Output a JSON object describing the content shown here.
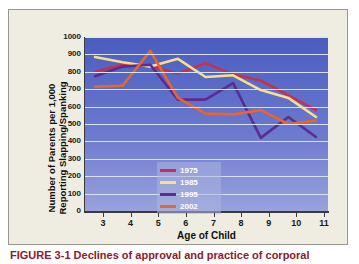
{
  "figure": {
    "caption": "FIGURE 3-1  Declines of approval and practice of corporal"
  },
  "chart_data": {
    "type": "line",
    "title": "",
    "xlabel": "Age of Child",
    "ylabel": "Number of Parents per 1,000 Reporting Slapping/Spanking",
    "x": [
      3,
      4,
      5,
      6,
      7,
      8,
      9,
      10,
      11
    ],
    "xtick_labels": [
      "3",
      "4",
      "5",
      "6",
      "7",
      "8",
      "9",
      "10",
      "11"
    ],
    "ytick_labels": [
      "0",
      "100",
      "200",
      "300",
      "400",
      "500",
      "600",
      "700",
      "800",
      "900",
      "1000"
    ],
    "ylim": [
      0,
      1000
    ],
    "ytick_step": 100,
    "grid": true,
    "legend_position": "inner-left",
    "series": [
      {
        "name": "1975",
        "color": "#c8304a",
        "values": [
          800,
          840,
          830,
          790,
          850,
          785,
          750,
          665,
          580
        ]
      },
      {
        "name": "1985",
        "color": "#f2e08a",
        "values": [
          885,
          855,
          830,
          875,
          770,
          780,
          695,
          650,
          540
        ]
      },
      {
        "name": "1995",
        "color": "#5b2d8e",
        "values": [
          775,
          830,
          840,
          640,
          640,
          735,
          420,
          540,
          425
        ]
      },
      {
        "name": "2002",
        "color": "#e8662a",
        "values": [
          715,
          720,
          920,
          650,
          560,
          555,
          580,
          500,
          520
        ]
      }
    ]
  },
  "axis": {
    "left_color": "#3a3a3a",
    "bottom_color": "#3a3a3a",
    "gridline_color": "#d9e2f5"
  },
  "colors": {
    "panel_background": "#efece1",
    "plot_background_top": "#4a5cc0",
    "plot_background_bottom": "#99a2dd",
    "caption_color": "#8c1a2b"
  }
}
